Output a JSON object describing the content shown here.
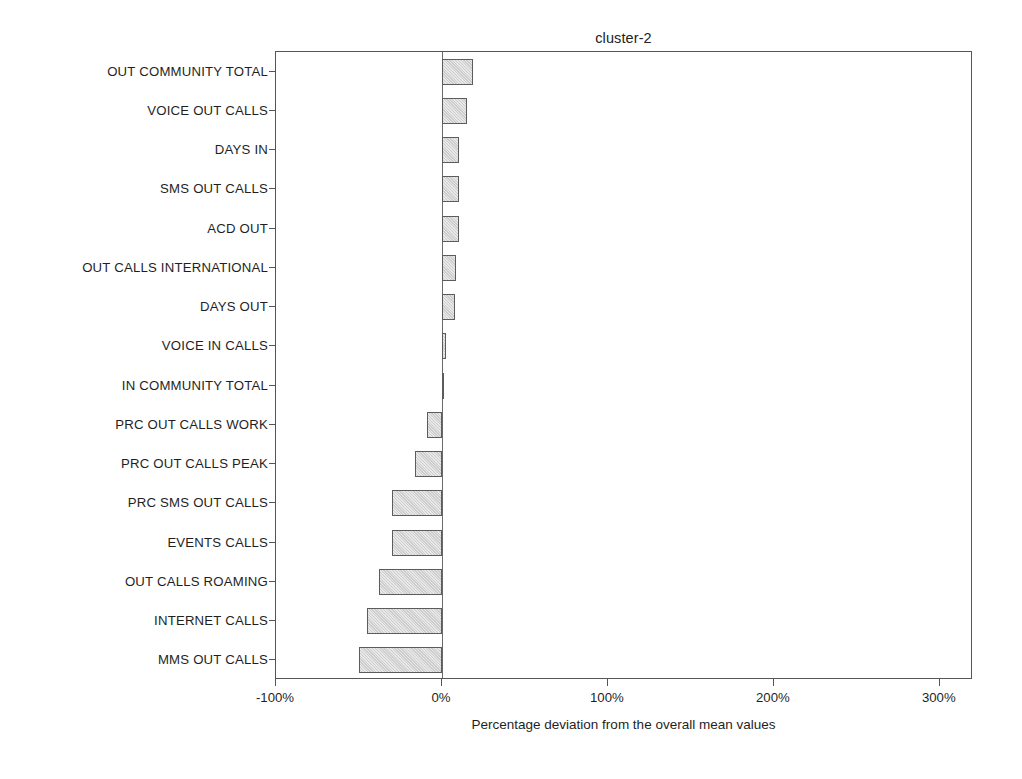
{
  "chart_data": {
    "type": "bar",
    "orientation": "horizontal",
    "title": "cluster-2",
    "xlabel": "Percentage deviation from the overall mean values",
    "ylabel": "",
    "xlim": [
      -100,
      320
    ],
    "xticks": [
      -100,
      0,
      100,
      200,
      300
    ],
    "xtick_labels": [
      "-100%",
      "0%",
      "100%",
      "200%",
      "300%"
    ],
    "grid": false,
    "legend": null,
    "zero_reference_line": 0,
    "bar_color": "#cdcdcd",
    "bar_edge_color": "#5c5c5c",
    "categories": [
      "OUT COMMUNITY TOTAL",
      "VOICE OUT CALLS",
      "DAYS IN",
      "SMS OUT CALLS",
      "ACD OUT",
      "OUT CALLS INTERNATIONAL",
      "DAYS OUT",
      "VOICE IN CALLS",
      "IN COMMUNITY TOTAL",
      "PRC OUT CALLS WORK",
      "PRC OUT CALLS PEAK",
      "PRC SMS OUT CALLS",
      "EVENTS CALLS",
      "OUT CALLS ROAMING",
      "INTERNET CALLS",
      "MMS OUT CALLS"
    ],
    "values": [
      19,
      15,
      10,
      10,
      10,
      8.5,
      8,
      2.5,
      1,
      -9,
      -16,
      -30,
      -30,
      -38,
      -45,
      -50
    ]
  }
}
